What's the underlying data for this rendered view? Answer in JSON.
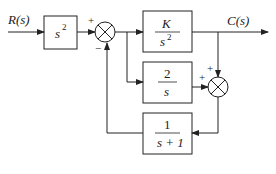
{
  "diagram": {
    "type": "block-diagram",
    "input_label": "R(s)",
    "output_label": "C(s)",
    "blocks": [
      {
        "id": "pre",
        "num": "s",
        "num_exp": "2",
        "den": ""
      },
      {
        "id": "forward",
        "num": "K",
        "den": "s",
        "den_exp": "2"
      },
      {
        "id": "parallel",
        "num": "2",
        "den": "s"
      },
      {
        "id": "feedback",
        "num": "1",
        "den": "s + 1"
      }
    ],
    "summing_junctions": [
      {
        "id": "sum1",
        "signs": {
          "top": "+",
          "bottom": "−"
        }
      },
      {
        "id": "sum2",
        "signs": {
          "top": "+",
          "left": "+"
        }
      }
    ],
    "stroke_color": "#222222",
    "background": "#ffffff"
  }
}
